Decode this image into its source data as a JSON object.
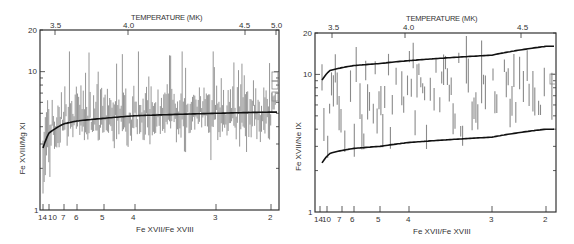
{
  "chart_data": [
    {
      "type": "scatter",
      "subtype": "error-bar",
      "title": "TEMPERATURE (MK)",
      "xlabel": "Fe XVII/Fe XVIII",
      "ylabel": "Fe XVIII/Mg XI",
      "yscale": "log",
      "ylim": [
        1,
        20
      ],
      "y_ticks": [
        "1",
        "10",
        "20"
      ],
      "x_bottom_ticks": [
        "14",
        "10",
        "7",
        "6",
        "5",
        "4",
        "3",
        "2"
      ],
      "x_top_ticks": [
        "3.5",
        "4.0",
        "4.5",
        "5.0"
      ],
      "grid": false,
      "legend": "none",
      "series": [
        {
          "name": "measurements",
          "style": "vertical error bars (gray)",
          "x_ratio_range": [
            14,
            1.9
          ],
          "y_range": [
            1.3,
            14
          ]
        },
        {
          "name": "model",
          "style": "solid black curve",
          "points": [
            {
              "x": 14,
              "y": 2.8
            },
            {
              "x": 7,
              "y": 4.2
            },
            {
              "x": 5,
              "y": 4.6
            },
            {
              "x": 4,
              "y": 4.8
            },
            {
              "x": 3,
              "y": 5.0
            },
            {
              "x": 2,
              "y": 5.1
            }
          ]
        }
      ]
    },
    {
      "type": "scatter",
      "subtype": "error-bar",
      "title": "TEMPERATURE (MK)",
      "xlabel": "Fe XVII/Fe XVIII",
      "ylabel": "Fe XVII/Ne IX",
      "yscale": "log",
      "ylim": [
        1,
        20
      ],
      "y_ticks": [
        "1",
        "10",
        "20"
      ],
      "x_bottom_ticks": [
        "14",
        "10",
        "7",
        "6",
        "5",
        "4",
        "3",
        "2"
      ],
      "x_top_ticks": [
        "3.5",
        "4.0",
        "4.5"
      ],
      "grid": false,
      "legend": "none",
      "series": [
        {
          "name": "measurements",
          "style": "vertical error bars (gray)",
          "x_ratio_range": [
            14,
            1.9
          ],
          "y_range": [
            2.5,
            18
          ]
        },
        {
          "name": "model-upper",
          "style": "solid black curve",
          "points": [
            {
              "x": 14,
              "y": 9.6
            },
            {
              "x": 7,
              "y": 11.2
            },
            {
              "x": 5,
              "y": 12.0
            },
            {
              "x": 4,
              "y": 12.6
            },
            {
              "x": 3,
              "y": 13.8
            },
            {
              "x": 2,
              "y": 16.0
            }
          ]
        },
        {
          "name": "model-lower",
          "style": "solid black curve",
          "points": [
            {
              "x": 14,
              "y": 2.4
            },
            {
              "x": 7,
              "y": 2.8
            },
            {
              "x": 5,
              "y": 3.0
            },
            {
              "x": 4,
              "y": 3.2
            },
            {
              "x": 3,
              "y": 3.5
            },
            {
              "x": 2,
              "y": 4.0
            }
          ]
        }
      ]
    }
  ],
  "panels": [
    {
      "title": "TEMPERATURE (MK)",
      "xlabel": "Fe XVII/Fe XVIII",
      "ylabel": "Fe XVIII/Mg XI",
      "y_ticks": [
        "20",
        "10",
        "1"
      ],
      "x_bottom_ticks": [
        "14",
        "10",
        "7",
        "6",
        "5",
        "4",
        "3",
        "2"
      ],
      "x_top_ticks": [
        "3.5",
        "4.0",
        "4.5",
        "5.0"
      ]
    },
    {
      "title": "TEMPERATURE (MK)",
      "xlabel": "Fe XVII/Fe XVIII",
      "ylabel": "Fe XVII/Ne IX",
      "y_ticks": [
        "20",
        "10",
        "1"
      ],
      "x_bottom_ticks": [
        "14",
        "10",
        "7",
        "6",
        "5",
        "4",
        "3",
        "2"
      ],
      "x_top_ticks": [
        "3.5",
        "4.0",
        "4.5"
      ]
    }
  ],
  "colors": {
    "axis": "#333333",
    "bars": "#8a8a8a",
    "curve": "#111111"
  }
}
